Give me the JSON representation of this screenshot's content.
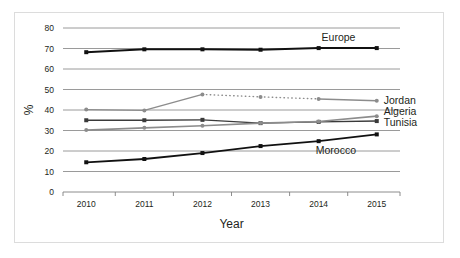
{
  "chart_data": {
    "type": "line",
    "title": "",
    "xlabel": "Year",
    "ylabel": "%",
    "x": [
      2010,
      2011,
      2012,
      2013,
      2014,
      2015
    ],
    "categories": [
      "2010",
      "2011",
      "2012",
      "2013",
      "2014",
      "2015"
    ],
    "ylim": [
      0,
      80
    ],
    "xlim": [
      2009.6,
      2015.4
    ],
    "yticks": [
      0,
      10,
      20,
      30,
      40,
      50,
      60,
      70,
      80
    ],
    "ytick_labels": [
      "0",
      "10",
      "20",
      "30",
      "40",
      "50",
      "60",
      "70",
      "80"
    ],
    "xtick_labels": [
      "2010",
      "2011",
      "2012",
      "2013",
      "2014",
      "2015"
    ],
    "grid": "horizontal",
    "legend": "series-labels-at-right",
    "series": [
      {
        "name": "Europe",
        "label": "Europe",
        "color": "#111111",
        "marker": "square",
        "linestyle": "solid",
        "linewidth": 2.0,
        "values": [
          68.2,
          69.6,
          69.6,
          69.4,
          70.2,
          70.2
        ]
      },
      {
        "name": "Jordan",
        "label": "Jordan",
        "color": "#8c8c8c",
        "marker": "circle",
        "linestyle": "mixed",
        "linewidth": 1.4,
        "values": [
          40.2,
          39.8,
          47.6,
          46.4,
          45.4,
          44.5
        ],
        "dotted_from": 2012,
        "dotted_to": 2014
      },
      {
        "name": "Algeria",
        "label": "Algeria",
        "color": "#3a3a3a",
        "marker": "square",
        "linestyle": "solid",
        "linewidth": 1.4,
        "values": [
          35.0,
          35.0,
          35.2,
          33.6,
          34.2,
          34.6
        ]
      },
      {
        "name": "Tunisia",
        "label": "Tunisia",
        "color": "#8c8c8c",
        "marker": "circle",
        "linestyle": "solid",
        "linewidth": 1.6,
        "values": [
          30.2,
          31.3,
          32.3,
          33.6,
          34.4,
          37.0
        ]
      },
      {
        "name": "Morocco",
        "label": "Morocco",
        "color": "#111111",
        "marker": "square",
        "linestyle": "solid",
        "linewidth": 1.8,
        "values": [
          14.5,
          16.1,
          19.0,
          22.4,
          24.8,
          28.1
        ]
      }
    ],
    "annotations": [
      {
        "text": "Europe",
        "series": "Europe",
        "x": 2014.05,
        "y": 75.5
      },
      {
        "text": "Jordan",
        "series": "Jordan",
        "x": 2015.12,
        "y": 44.8
      },
      {
        "text": "Algeria",
        "series": "Algeria",
        "x": 2015.12,
        "y": 39.2
      },
      {
        "text": "Tunisia",
        "series": "Tunisia",
        "x": 2015.12,
        "y": 33.8
      },
      {
        "text": "Morocco",
        "series": "Morocco",
        "x": 2013.95,
        "y": 20.2
      }
    ]
  }
}
